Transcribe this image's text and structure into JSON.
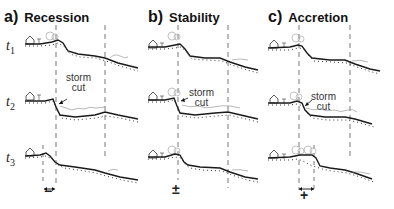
{
  "panels": [
    {
      "letter": "a)",
      "name": "Recession",
      "result_symbol": "−",
      "storm_label": [
        "storm",
        "cut"
      ]
    },
    {
      "letter": "b)",
      "name": "Stability",
      "result_symbol": "±",
      "storm_label": [
        "storm",
        "cut"
      ]
    },
    {
      "letter": "c)",
      "name": "Accretion",
      "result_symbol": "+",
      "storm_label": [
        "storm",
        "cut"
      ]
    }
  ],
  "time_labels": [
    {
      "t": "t",
      "sub": "1"
    },
    {
      "t": "t",
      "sub": "2"
    },
    {
      "t": "t",
      "sub": "3"
    }
  ],
  "colors": {
    "line": "#1a1a1a",
    "dashed": "#555555",
    "thin": "#888888"
  }
}
